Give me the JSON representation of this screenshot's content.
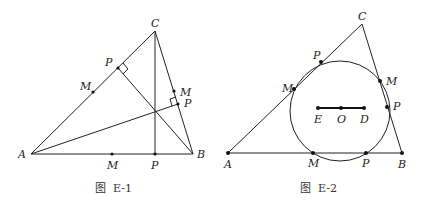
{
  "figures": [
    {
      "id": "E-1",
      "caption": "图  E-1",
      "vertices": {
        "A": {
          "label": "A",
          "x": 31,
          "y": 154
        },
        "B": {
          "label": "B",
          "x": 193,
          "y": 154
        },
        "C": {
          "label": "C",
          "x": 155,
          "y": 31
        }
      },
      "points": [
        {
          "label": "P",
          "x": 118,
          "y": 68,
          "lx": 105,
          "ly": 66
        },
        {
          "label": "M",
          "x": 93,
          "y": 92,
          "lx": 80,
          "ly": 90
        },
        {
          "label": "M",
          "x": 174,
          "y": 91,
          "lx": 180,
          "ly": 96
        },
        {
          "label": "P",
          "x": 178,
          "y": 104,
          "lx": 184,
          "ly": 107
        },
        {
          "label": "M",
          "x": 112,
          "y": 154,
          "lx": 107,
          "ly": 169
        },
        {
          "label": "P",
          "x": 155,
          "y": 154,
          "lx": 151,
          "ly": 169
        }
      ],
      "label_positions": {
        "A": {
          "x": 18,
          "y": 158
        },
        "B": {
          "x": 197,
          "y": 158
        },
        "C": {
          "x": 151,
          "y": 27
        }
      }
    },
    {
      "id": "E-2",
      "caption": "图  E-2",
      "vertices": {
        "A": {
          "label": "A",
          "x": 228,
          "y": 153
        },
        "B": {
          "label": "B",
          "x": 402,
          "y": 153
        },
        "C": {
          "label": "C",
          "x": 362,
          "y": 24
        }
      },
      "circle": {
        "cx": 340,
        "cy": 111,
        "r": 50
      },
      "segment": [
        {
          "label": "E",
          "x": 318,
          "y": 108,
          "lx": 314,
          "ly": 123
        },
        {
          "label": "O",
          "x": 341,
          "y": 108,
          "lx": 337,
          "ly": 123
        },
        {
          "label": "D",
          "x": 364,
          "y": 108,
          "lx": 360,
          "ly": 123
        }
      ],
      "points": [
        {
          "label": "P",
          "x": 321,
          "y": 62,
          "lx": 313,
          "ly": 59
        },
        {
          "label": "M",
          "x": 294,
          "y": 89,
          "lx": 282,
          "ly": 92
        },
        {
          "label": "M",
          "x": 380,
          "y": 81,
          "lx": 386,
          "ly": 85
        },
        {
          "label": "P",
          "x": 387,
          "y": 107,
          "lx": 393,
          "ly": 110
        },
        {
          "label": "M",
          "x": 313,
          "y": 153,
          "lx": 308,
          "ly": 167
        },
        {
          "label": "P",
          "x": 366,
          "y": 153,
          "lx": 362,
          "ly": 167
        }
      ],
      "label_positions": {
        "A": {
          "x": 224,
          "y": 168
        },
        "B": {
          "x": 398,
          "y": 168
        },
        "C": {
          "x": 358,
          "y": 20
        }
      }
    }
  ]
}
